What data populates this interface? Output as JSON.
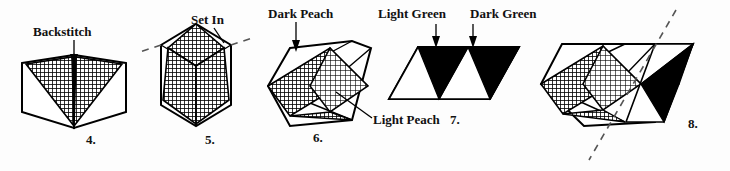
{
  "figures": [
    {
      "number": "4.",
      "label": "Backstitch",
      "shape": "butterfly-two-panel",
      "fills": [
        "crosshatch-dark",
        "crosshatch-dark"
      ],
      "leader": "vertical-arrow-down"
    },
    {
      "number": "5.",
      "label": "Set In",
      "shape": "cube-hexagon-with-star",
      "fills": [
        "crosshatch-dark",
        "crosshatch-dark",
        "crosshatch-dark"
      ],
      "leader": "diagonal-line"
    },
    {
      "number": "6.",
      "labels": [
        "Dark Peach",
        "Light Peach"
      ],
      "shape": "hexagon-with-two-diamonds",
      "fills": [
        "crosshatch-dark",
        "crosshatch-light"
      ],
      "leaders": [
        "vertical-arrow-down",
        "diagonal-line"
      ]
    },
    {
      "number": "7.",
      "labels": [
        "Light Green",
        "Dark Green"
      ],
      "shape": "parallelogram-two-units",
      "fills": [
        "white",
        "black",
        "white",
        "black"
      ],
      "leaders": [
        "vertical-arrow-down",
        "vertical-arrow-down"
      ]
    },
    {
      "number": "8.",
      "shape": "hexagon-joined-to-parallelogram",
      "fills": [
        "crosshatch-dark",
        "crosshatch-light",
        "black",
        "black"
      ],
      "marker": "dashed-seam-line"
    }
  ],
  "labels": {
    "backstitch": "Backstitch",
    "set_in": "Set In",
    "dark_peach": "Dark Peach",
    "light_peach": "Light Peach",
    "light_green": "Light Green",
    "dark_green": "Dark Green"
  },
  "numbers": {
    "four": "4.",
    "five": "5.",
    "six": "6.",
    "seven": "7.",
    "eight": "8."
  },
  "colors": {
    "ink": "#111111",
    "background": "#fdfdfd",
    "solid_fill": "#000000",
    "dash_line": "#555555"
  }
}
